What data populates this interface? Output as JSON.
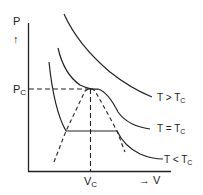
{
  "diagram": {
    "axes": {
      "y_label": "P",
      "y_arrow": "↑",
      "x_label": "→ V"
    },
    "critical": {
      "pressure_label_main": "P",
      "pressure_label_sub": "C",
      "volume_label_main": "V",
      "volume_label_sub": "C"
    },
    "isotherms": [
      {
        "id": "above",
        "label_main": "T > T",
        "label_sub": "C"
      },
      {
        "id": "critical",
        "label_main": "T = T",
        "label_sub": "C"
      },
      {
        "id": "below",
        "label_main": "T < T",
        "label_sub": "C"
      }
    ],
    "colors": {
      "line": "#222222",
      "background": "#ffffff"
    }
  }
}
